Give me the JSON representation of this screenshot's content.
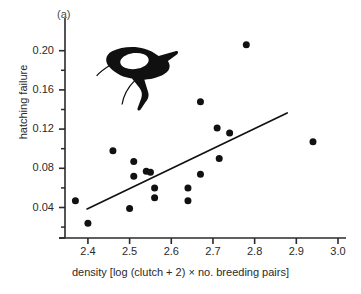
{
  "figure": {
    "panel_label": "(a)",
    "truncated_title": "",
    "decoration": "bird-silhouette"
  },
  "chart_data": {
    "type": "scatter",
    "title": "",
    "panel": "(a)",
    "xlabel": "density [log (clutch + 2) × no. breeding pairs]",
    "ylabel": "hatching failure",
    "xlim": [
      2.345,
      3.0
    ],
    "ylim": [
      0.015,
      0.215
    ],
    "grid": false,
    "legend": "none",
    "xticks": [
      2.4,
      2.5,
      2.6,
      2.7,
      2.8,
      2.9,
      3.0
    ],
    "xtick_labels": [
      "2.4",
      "2.5",
      "2.6",
      "2.7",
      "2.8",
      "2.9",
      "3.0"
    ],
    "yticks": [
      0.04,
      0.08,
      0.12,
      0.16,
      0.2
    ],
    "ytick_labels": [
      "0.04",
      "0.08",
      "0.12",
      "0.16",
      "0.20"
    ],
    "y_minor_ticks": [
      0.02,
      0.06,
      0.1,
      0.14,
      0.18
    ],
    "points": [
      {
        "x": 2.37,
        "y": 0.047
      },
      {
        "x": 2.4,
        "y": 0.024
      },
      {
        "x": 2.46,
        "y": 0.098
      },
      {
        "x": 2.5,
        "y": 0.039
      },
      {
        "x": 2.51,
        "y": 0.087
      },
      {
        "x": 2.51,
        "y": 0.072
      },
      {
        "x": 2.54,
        "y": 0.077
      },
      {
        "x": 2.55,
        "y": 0.076
      },
      {
        "x": 2.56,
        "y": 0.06
      },
      {
        "x": 2.56,
        "y": 0.05
      },
      {
        "x": 2.64,
        "y": 0.06
      },
      {
        "x": 2.64,
        "y": 0.047
      },
      {
        "x": 2.67,
        "y": 0.148
      },
      {
        "x": 2.67,
        "y": 0.074
      },
      {
        "x": 2.71,
        "y": 0.121
      },
      {
        "x": 2.715,
        "y": 0.09
      },
      {
        "x": 2.74,
        "y": 0.116
      },
      {
        "x": 2.78,
        "y": 0.206
      },
      {
        "x": 2.94,
        "y": 0.107
      }
    ],
    "fit_line": {
      "x0": 2.398,
      "y0": 0.0385,
      "x1": 2.878,
      "y1": 0.1365
    },
    "marker": {
      "shape": "circle",
      "color": "#111111",
      "size_px": 7
    },
    "line_color": "#111111",
    "axis_color": "#2a2a2a"
  }
}
